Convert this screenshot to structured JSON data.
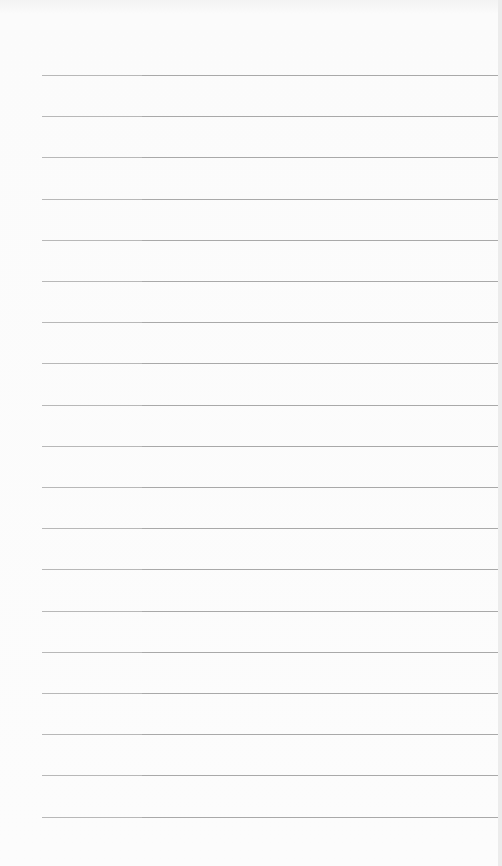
{
  "paper": {
    "type": "lined-paper",
    "background_color": "#fbfbfb",
    "rule_color": "#a9a9a9",
    "rule_count": 19,
    "rule_left_px": 42,
    "first_rule_y": 75,
    "rule_spacing_px": 41.2
  }
}
